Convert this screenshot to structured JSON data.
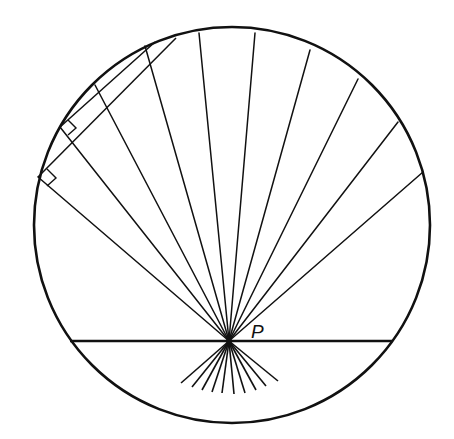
{
  "figure": {
    "stroke_color": "#111111",
    "background": "#ffffff",
    "circle": {
      "cx": 232,
      "cy": 225,
      "r": 198
    },
    "point_P": {
      "x": 229,
      "y": 341,
      "label": "P",
      "label_x": 251,
      "label_y": 338
    },
    "horizontal_chord": {
      "x1": 70,
      "y1": 341,
      "x2": 392,
      "y2": 341
    },
    "rays_to_circle": [
      {
        "x": 38,
        "y": 177
      },
      {
        "x": 60,
        "y": 127
      },
      {
        "x": 95,
        "y": 85
      },
      {
        "x": 145,
        "y": 46
      },
      {
        "x": 199,
        "y": 33
      },
      {
        "x": 255,
        "y": 33
      },
      {
        "x": 310,
        "y": 50
      },
      {
        "x": 358,
        "y": 79
      },
      {
        "x": 398,
        "y": 122
      },
      {
        "x": 423,
        "y": 172
      }
    ],
    "fan_below_P": [
      {
        "x": 181,
        "y": 383
      },
      {
        "x": 192,
        "y": 387
      },
      {
        "x": 202,
        "y": 390
      },
      {
        "x": 212,
        "y": 392
      },
      {
        "x": 222,
        "y": 393
      },
      {
        "x": 234,
        "y": 394
      },
      {
        "x": 245,
        "y": 393
      },
      {
        "x": 256,
        "y": 390
      },
      {
        "x": 266,
        "y": 386
      },
      {
        "x": 278,
        "y": 381
      }
    ],
    "perpendicular_chords": [
      {
        "x1": 60,
        "y1": 127,
        "x2": 155,
        "y2": 42
      },
      {
        "x1": 38,
        "y1": 177,
        "x2": 176,
        "y2": 38
      }
    ],
    "right_angle_marks": [
      {
        "points": "60,127 68,120 76,128 68,135"
      },
      {
        "points": "38,177 47,169 56,178 47,186"
      }
    ]
  }
}
